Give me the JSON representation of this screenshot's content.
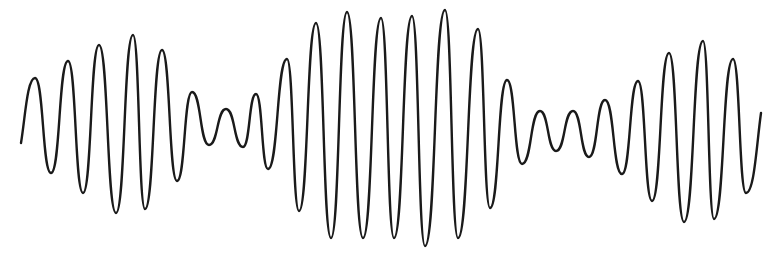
{
  "figure": {
    "stroke_color": "#1a1a1a",
    "background_color": "#ffffff"
  },
  "chart_data": {
    "type": "line",
    "title": "",
    "xlabel": "",
    "ylabel": "",
    "grid": false,
    "legend": null,
    "axes_visible": false,
    "coordinate_space": "pixel (777x253, y down)",
    "start_point": [
      21,
      143
    ],
    "end_point": [
      761,
      113
    ],
    "extrema": [
      [
        35,
        78
      ],
      [
        51,
        173
      ],
      [
        68,
        61
      ],
      [
        83,
        193
      ],
      [
        99,
        45
      ],
      [
        116,
        213
      ],
      [
        133,
        35
      ],
      [
        145,
        209
      ],
      [
        162,
        50
      ],
      [
        177,
        181
      ],
      [
        192,
        92
      ],
      [
        209,
        145
      ],
      [
        226,
        109
      ],
      [
        243,
        147
      ],
      [
        256,
        94
      ],
      [
        268,
        169
      ],
      [
        287,
        59
      ],
      [
        299,
        211
      ],
      [
        316,
        23
      ],
      [
        331,
        238
      ],
      [
        347,
        12
      ],
      [
        363,
        238
      ],
      [
        381,
        18
      ],
      [
        394,
        238
      ],
      [
        412,
        16
      ],
      [
        425,
        246
      ],
      [
        445,
        10
      ],
      [
        458,
        238
      ],
      [
        478,
        29
      ],
      [
        490,
        208
      ],
      [
        507,
        80
      ],
      [
        522,
        164
      ],
      [
        540,
        111
      ],
      [
        556,
        151
      ],
      [
        573,
        111
      ],
      [
        589,
        157
      ],
      [
        605,
        100
      ],
      [
        622,
        174
      ],
      [
        638,
        81
      ],
      [
        652,
        201
      ],
      [
        669,
        53
      ],
      [
        684,
        222
      ],
      [
        703,
        41
      ],
      [
        714,
        219
      ],
      [
        733,
        59
      ],
      [
        746,
        193
      ]
    ],
    "envelope_notes": "Amplitude swells at left (~x=133), shrinks near x=226, max near x=400, shrinks near x=560, swells again near x=703"
  }
}
